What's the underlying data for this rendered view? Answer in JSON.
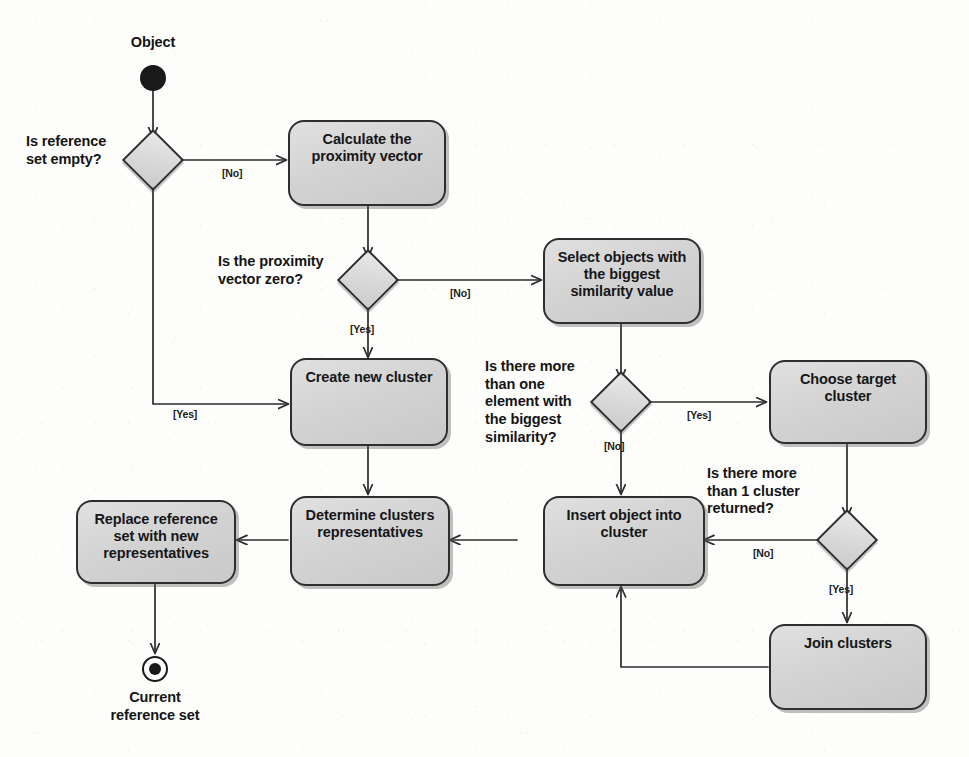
{
  "diagram": {
    "type": "uml-activity-diagram",
    "colors": {
      "node_fill": "#d3d3d3",
      "node_border": "#2e2e2e",
      "diamond_fill": "#dcdcdc",
      "edge": "#2b2b2b",
      "text": "#141414",
      "background": "#fdfdfc"
    },
    "start_label": "Object",
    "end_label": "Current\nreference set",
    "nodes": [
      {
        "id": "calculate",
        "label": "Calculate the\nproximity vector"
      },
      {
        "id": "select",
        "label": "Select objects with\nthe biggest\nsimilarity value"
      },
      {
        "id": "create",
        "label": "Create new cluster"
      },
      {
        "id": "choose",
        "label": "Choose target\ncluster"
      },
      {
        "id": "insert",
        "label": "Insert object into\ncluster"
      },
      {
        "id": "determine",
        "label": "Determine clusters\nrepresentatives"
      },
      {
        "id": "replace",
        "label": "Replace reference\nset with new\nrepresentatives"
      },
      {
        "id": "join",
        "label": "Join clusters"
      }
    ],
    "decisions": [
      {
        "id": "d1",
        "question": "Is reference\nset empty?"
      },
      {
        "id": "d2",
        "question": "Is the proximity\nvector zero?"
      },
      {
        "id": "d3",
        "question": "Is there more\nthan one\nelement with\nthe biggest\nsimilarity?"
      },
      {
        "id": "d4",
        "question": "Is there more\nthan 1 cluster\nreturned?"
      }
    ],
    "guards": [
      {
        "id": "g1",
        "text": "[No]",
        "from": "d1",
        "to": "calculate"
      },
      {
        "id": "g2",
        "text": "[Yes]",
        "from": "d1",
        "to": "create"
      },
      {
        "id": "g3",
        "text": "[No]",
        "from": "d2",
        "to": "select"
      },
      {
        "id": "g4",
        "text": "[Yes]",
        "from": "d2",
        "to": "create"
      },
      {
        "id": "g5",
        "text": "[Yes]",
        "from": "d3",
        "to": "choose"
      },
      {
        "id": "g6",
        "text": "[No]",
        "from": "d3",
        "to": "insert"
      },
      {
        "id": "g7",
        "text": "[No]",
        "from": "d4",
        "to": "insert"
      },
      {
        "id": "g8",
        "text": "[Yes]",
        "from": "d4",
        "to": "join"
      }
    ]
  }
}
